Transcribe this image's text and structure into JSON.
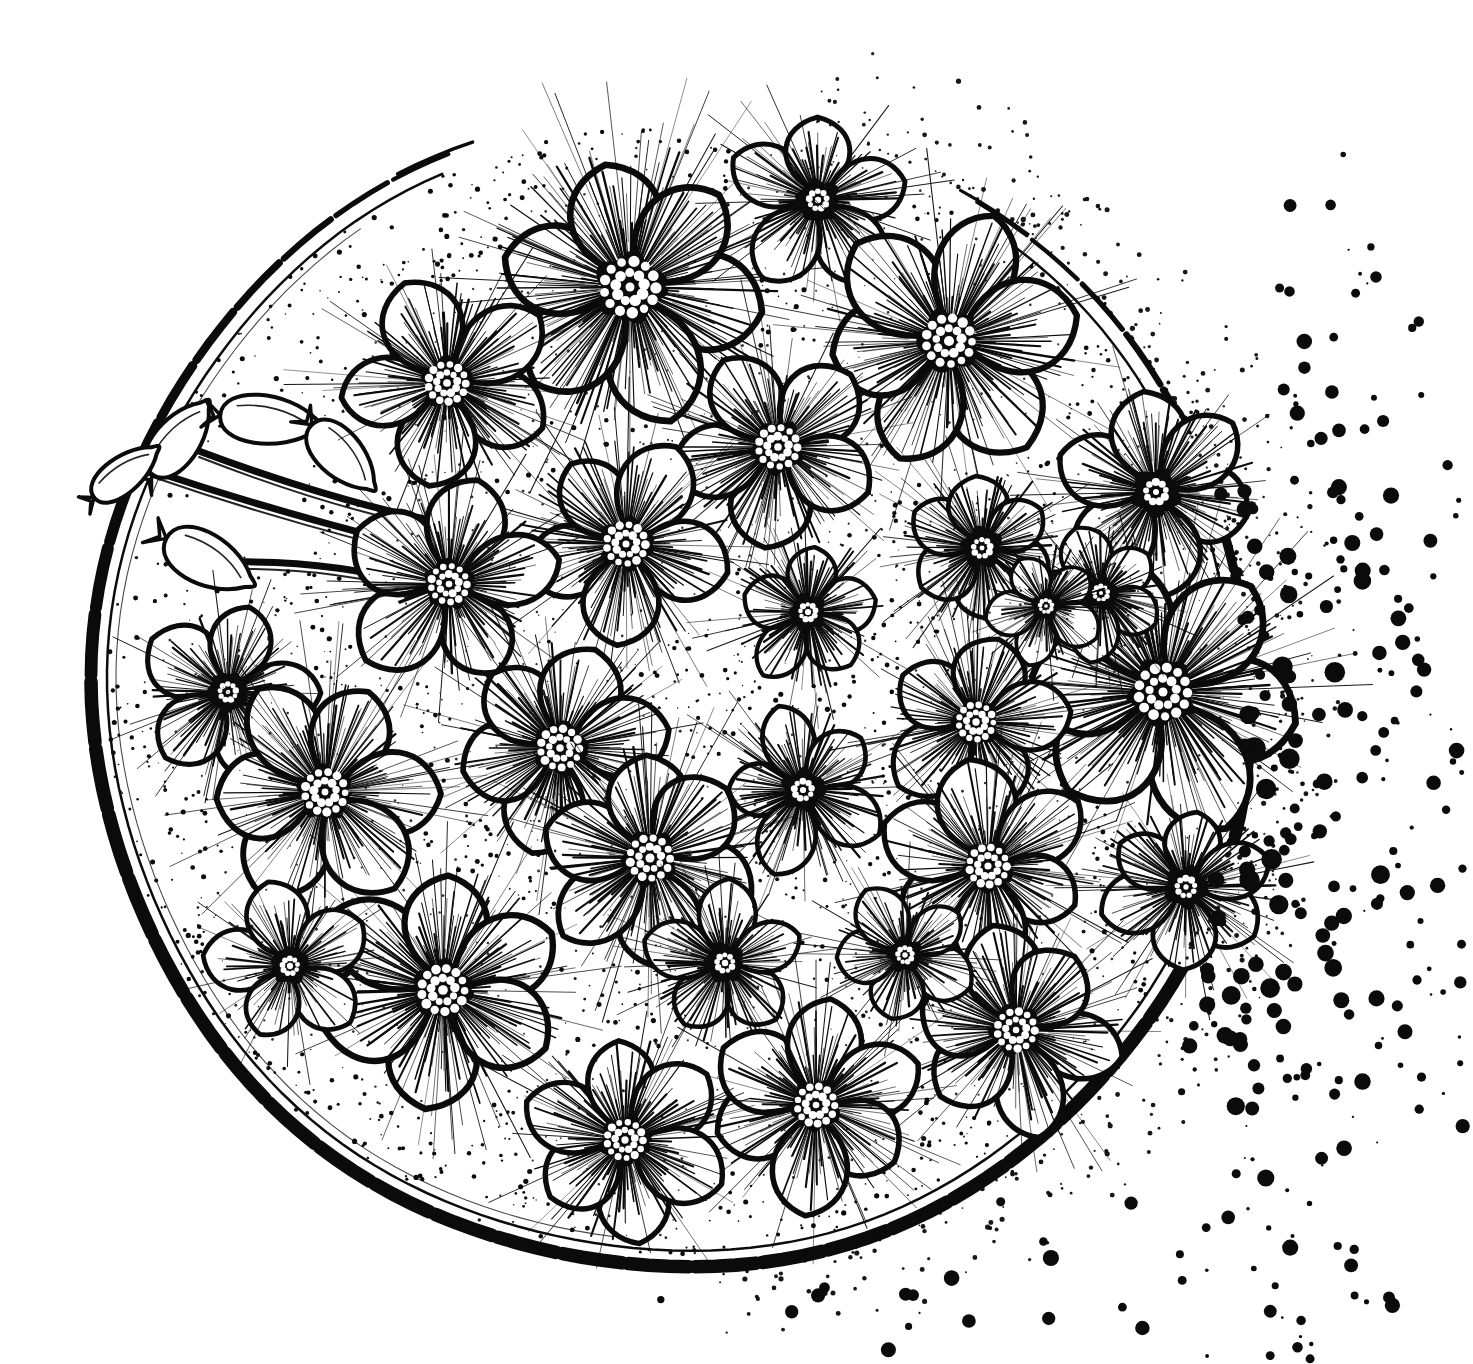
{
  "artwork": {
    "title": "Circular Floral Ink Illustration",
    "medium": "pen-and-ink line drawing",
    "subject": "dense circular bouquet of five-petal phlox flowers with buds and scattered ink dots",
    "background_color": "#ffffff",
    "ink_color": "#0b0b0b",
    "canvas": {
      "width": 1473,
      "height": 1364
    }
  },
  "frame": {
    "name": "circle-rim",
    "center_x": 672,
    "center_y": 690,
    "radius_x": 578,
    "radius_y": 578,
    "outer_stroke": 13,
    "inner_stroke": 2.5,
    "inner_gap": 16,
    "arc_start_deg": -58,
    "arc_end_deg": 248,
    "note": "heavy brushed double rim, open / dissolving on the right side into dots"
  },
  "flowers": [
    {
      "id": 1,
      "cx": 630,
      "cy": 287,
      "r": 136,
      "petals": 6,
      "rot": 12,
      "core": 36,
      "stamen_rows": 3
    },
    {
      "id": 2,
      "cx": 447,
      "cy": 383,
      "r": 110,
      "petals": 5,
      "rot": 30,
      "core": 26,
      "stamen_rows": 3
    },
    {
      "id": 3,
      "cx": 818,
      "cy": 200,
      "r": 92,
      "petals": 5,
      "rot": 200,
      "core": 22,
      "stamen_rows": 2
    },
    {
      "id": 4,
      "cx": 949,
      "cy": 341,
      "r": 128,
      "petals": 6,
      "rot": 52,
      "core": 32,
      "stamen_rows": 3
    },
    {
      "id": 5,
      "cx": 778,
      "cy": 447,
      "r": 110,
      "petals": 5,
      "rot": 96,
      "core": 27,
      "stamen_rows": 3
    },
    {
      "id": 6,
      "cx": 1156,
      "cy": 492,
      "r": 104,
      "petals": 6,
      "rot": 18,
      "core": 25,
      "stamen_rows": 2
    },
    {
      "id": 7,
      "cx": 626,
      "cy": 544,
      "r": 108,
      "petals": 5,
      "rot": 160,
      "core": 27,
      "stamen_rows": 3
    },
    {
      "id": 8,
      "cx": 449,
      "cy": 584,
      "r": 112,
      "petals": 5,
      "rot": 66,
      "core": 25,
      "stamen_rows": 3
    },
    {
      "id": 9,
      "cx": 982,
      "cy": 548,
      "r": 80,
      "petals": 6,
      "rot": 24,
      "core": 21,
      "stamen_rows": 2
    },
    {
      "id": 10,
      "cx": 808,
      "cy": 612,
      "r": 74,
      "petals": 5,
      "rot": 130,
      "core": 19,
      "stamen_rows": 2
    },
    {
      "id": 11,
      "cx": 1163,
      "cy": 692,
      "r": 142,
      "petals": 6,
      "rot": 8,
      "core": 34,
      "stamen_rows": 3
    },
    {
      "id": 12,
      "cx": 228,
      "cy": 692,
      "r": 96,
      "petals": 5,
      "rot": 210,
      "core": 20,
      "stamen_rows": 2
    },
    {
      "id": 13,
      "cx": 560,
      "cy": 748,
      "r": 110,
      "petals": 6,
      "rot": 44,
      "core": 27,
      "stamen_rows": 3
    },
    {
      "id": 14,
      "cx": 803,
      "cy": 790,
      "r": 84,
      "petals": 5,
      "rot": 178,
      "core": 22,
      "stamen_rows": 2
    },
    {
      "id": 15,
      "cx": 325,
      "cy": 792,
      "r": 116,
      "petals": 6,
      "rot": 118,
      "core": 28,
      "stamen_rows": 3
    },
    {
      "id": 16,
      "cx": 976,
      "cy": 722,
      "r": 96,
      "petals": 5,
      "rot": 70,
      "core": 24,
      "stamen_rows": 3
    },
    {
      "id": 17,
      "cx": 650,
      "cy": 858,
      "r": 112,
      "petals": 6,
      "rot": 22,
      "core": 28,
      "stamen_rows": 3
    },
    {
      "id": 18,
      "cx": 988,
      "cy": 866,
      "r": 106,
      "petals": 6,
      "rot": 142,
      "core": 26,
      "stamen_rows": 3
    },
    {
      "id": 19,
      "cx": 1186,
      "cy": 887,
      "r": 86,
      "petals": 6,
      "rot": 36,
      "core": 22,
      "stamen_rows": 2
    },
    {
      "id": 20,
      "cx": 443,
      "cy": 990,
      "r": 128,
      "petals": 6,
      "rot": 96,
      "core": 30,
      "stamen_rows": 3
    },
    {
      "id": 21,
      "cx": 290,
      "cy": 966,
      "r": 84,
      "petals": 5,
      "rot": 188,
      "core": 19,
      "stamen_rows": 2
    },
    {
      "id": 22,
      "cx": 725,
      "cy": 963,
      "r": 80,
      "petals": 5,
      "rot": 54,
      "core": 20,
      "stamen_rows": 2
    },
    {
      "id": 23,
      "cx": 1016,
      "cy": 1030,
      "r": 106,
      "petals": 6,
      "rot": 14,
      "core": 26,
      "stamen_rows": 3
    },
    {
      "id": 24,
      "cx": 816,
      "cy": 1105,
      "r": 108,
      "petals": 6,
      "rot": 158,
      "core": 26,
      "stamen_rows": 3
    },
    {
      "id": 25,
      "cx": 625,
      "cy": 1140,
      "r": 104,
      "petals": 6,
      "rot": 80,
      "core": 25,
      "stamen_rows": 3
    },
    {
      "id": 26,
      "cx": 1101,
      "cy": 593,
      "r": 68,
      "petals": 5,
      "rot": 244,
      "core": 17,
      "stamen_rows": 2
    },
    {
      "id": 27,
      "cx": 1046,
      "cy": 606,
      "r": 60,
      "petals": 5,
      "rot": 100,
      "core": 15,
      "stamen_rows": 2
    },
    {
      "id": 28,
      "cx": 905,
      "cy": 955,
      "r": 74,
      "petals": 5,
      "rot": 28,
      "core": 18,
      "stamen_rows": 2
    }
  ],
  "buds": [
    {
      "id": "bud-1",
      "cx": 178,
      "cy": 440,
      "len": 86,
      "w": 30,
      "rot": -52
    },
    {
      "id": "bud-2",
      "cx": 124,
      "cy": 474,
      "len": 76,
      "w": 24,
      "rot": -38
    },
    {
      "id": "bud-3",
      "cx": 207,
      "cy": 560,
      "len": 92,
      "w": 34,
      "rot": 28
    },
    {
      "id": "bud-4",
      "cx": 268,
      "cy": 420,
      "len": 96,
      "w": 32,
      "rot": 6
    },
    {
      "id": "bud-5",
      "cx": 341,
      "cy": 455,
      "len": 84,
      "w": 30,
      "rot": 46
    }
  ],
  "stems": [
    {
      "id": "stem-1",
      "x1": 150,
      "y1": 470,
      "cx": 300,
      "cy": 520,
      "x2": 470,
      "y2": 560
    },
    {
      "id": "stem-2",
      "x1": 196,
      "y1": 450,
      "cx": 330,
      "cy": 500,
      "x2": 430,
      "y2": 520
    },
    {
      "id": "stem-3",
      "x1": 232,
      "y1": 562,
      "cx": 330,
      "cy": 560,
      "x2": 420,
      "y2": 585
    }
  ],
  "dot_spray": {
    "name": "ink-dot-spray",
    "origin_x": 1180,
    "origin_y": 760,
    "count": 260,
    "min_radius": 1.2,
    "max_radius": 11.5,
    "spread_start_deg": -72,
    "spread_end_deg": 86,
    "inner_distance": 40,
    "outer_distance": 620,
    "description": "ink droplets spilling off the right and lower-right of the circle, increasing in spacing outward"
  },
  "stipple": {
    "name": "petal-gap-stipple",
    "density": 1600,
    "dot_min": 0.7,
    "dot_max": 2.6,
    "description": "fine dotted shading filling the interstitial gaps between petals"
  },
  "render_seed": 20240517
}
